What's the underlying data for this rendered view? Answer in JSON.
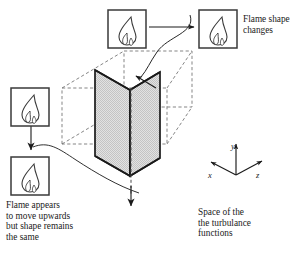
{
  "diagram": {
    "colors": {
      "stroke": "#1a1a1a",
      "plane_fill": "#d9d9d9",
      "box_dashed": "#7a7a7a",
      "background": "#ffffff"
    }
  },
  "annotations": {
    "flame_shape_changes": "Flame shape\nchanges",
    "flame_appears": "Flame appears\nto move upwards\nbut shape remains\nthe same",
    "space_of_turbulance": "Space of the\nthe turbulance\nfunctions"
  },
  "axes": {
    "y": "y",
    "x": "x",
    "z": "z"
  },
  "icons": {
    "flame_top_left": "flame-icon",
    "flame_top_right": "flame-icon",
    "flame_mid_left": "flame-icon",
    "flame_bottom_left": "flame-icon",
    "arrow_horizontal": "arrow-right-icon",
    "arrow_down_left": "arrow-down-icon",
    "arrow_down_plane": "arrow-down-icon",
    "leader_top": "curved-leader-arrow-icon",
    "leader_bottom": "curved-leader-icon"
  }
}
